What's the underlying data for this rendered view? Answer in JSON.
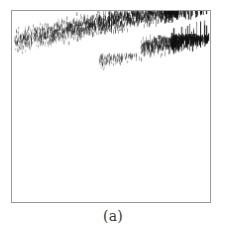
{
  "figure": {
    "caption": "(a)",
    "frame": {
      "border_color": "#9a9a9a",
      "background_color": "#ffffff",
      "x": 11,
      "y": 10,
      "width": 200,
      "height": 193
    }
  },
  "chart_data": {
    "type": "scatter",
    "title": "",
    "subtitle": "",
    "xlabel": "",
    "ylabel": "",
    "xlim": [
      0,
      200
    ],
    "ylim": [
      0,
      193
    ],
    "grid": false,
    "legend": null,
    "ink_color": "#1a1a1a",
    "series": [
      {
        "name": "upper-band",
        "marker": "vertical-tick",
        "x_range": [
          2,
          198
        ],
        "y_range": [
          2,
          45
        ],
        "point_count": 2200,
        "density": "high",
        "slope": -0.21,
        "band_thickness": 16,
        "darkest_x_range": [
          150,
          198
        ]
      },
      {
        "name": "lower-band",
        "marker": "vertical-tick",
        "x_range": [
          88,
          198
        ],
        "y_range": [
          28,
          62
        ],
        "point_count": 1100,
        "density": "medium",
        "slope": -0.24,
        "band_thickness": 14,
        "darkest_x_range": [
          160,
          198
        ]
      }
    ],
    "annotations": [
      {
        "label": "white-wedge",
        "x_range": [
          70,
          130
        ],
        "y_range": [
          24,
          44
        ],
        "note": "blank wedge separating the two bands"
      }
    ]
  }
}
